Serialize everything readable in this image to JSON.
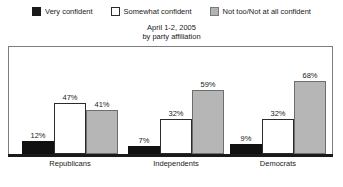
{
  "chart_data": {
    "type": "bar",
    "title": "April 1-2, 2005",
    "subtitle": "by party affiliation",
    "xlabel": "",
    "ylabel": "",
    "ylim": [
      0,
      100
    ],
    "grid": false,
    "legend_position": "top",
    "categories": [
      "Republicans",
      "Independents",
      "Democrats"
    ],
    "series": [
      {
        "name": "Very confident",
        "color": "#111111",
        "values": [
          12,
          7,
          9
        ],
        "labels": [
          "12%",
          "7%",
          "9%"
        ]
      },
      {
        "name": "Somewhat confident",
        "color": "#ffffff",
        "values": [
          47,
          32,
          32
        ],
        "labels": [
          "47%",
          "32%",
          "32%"
        ]
      },
      {
        "name": "Not too/Not at all confident",
        "color": "#b6b6b6",
        "values": [
          41,
          59,
          68
        ],
        "labels": [
          "41%",
          "59%",
          "68%"
        ]
      }
    ]
  },
  "legend": {
    "items": [
      {
        "label": "Very confident",
        "swatch": "swatch-black"
      },
      {
        "label": "Somewhat confident",
        "swatch": "swatch-white"
      },
      {
        "label": "Not too/Not at all confident",
        "swatch": "swatch-gray"
      }
    ]
  },
  "title": {
    "line1": "April 1-2, 2005",
    "line2": "by party affiliation"
  },
  "colors": {
    "very_confident": "#111111",
    "somewhat_confident": "#ffffff",
    "not_confident": "#b6b6b6",
    "frame": "#7d7d7d",
    "axis": "#1a1a1a",
    "text": "#1a1a1a",
    "background": "#ffffff"
  }
}
